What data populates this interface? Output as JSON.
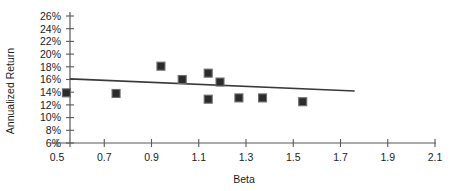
{
  "chart_data": {
    "type": "scatter",
    "title": "",
    "xlabel": "Beta",
    "ylabel": "Annualized Return",
    "xlim": [
      0.5,
      2.1
    ],
    "ylim": [
      6,
      26
    ],
    "grid": false,
    "legend": "none",
    "x_ticks": [
      "0.5",
      "0.7",
      "0.9",
      "1.1",
      "1.3",
      "1.5",
      "1.7",
      "1.9",
      "2.1"
    ],
    "x_tick_values": [
      0.5,
      0.7,
      0.9,
      1.1,
      1.3,
      1.5,
      1.7,
      1.9,
      2.1
    ],
    "y_ticks": [
      "6%",
      "8%",
      "10%",
      "12%",
      "14%",
      "16%",
      "18%",
      "20%",
      "22%",
      "24%",
      "26%"
    ],
    "y_tick_values": [
      6,
      8,
      10,
      12,
      14,
      16,
      18,
      20,
      22,
      24,
      26
    ],
    "points": [
      {
        "x": 0.54,
        "y": 13.9
      },
      {
        "x": 0.75,
        "y": 13.8
      },
      {
        "x": 0.94,
        "y": 18.1
      },
      {
        "x": 1.03,
        "y": 16.0
      },
      {
        "x": 1.14,
        "y": 17.0
      },
      {
        "x": 1.14,
        "y": 12.9
      },
      {
        "x": 1.19,
        "y": 15.6
      },
      {
        "x": 1.27,
        "y": 13.1
      },
      {
        "x": 1.37,
        "y": 13.1
      },
      {
        "x": 1.54,
        "y": 12.5
      }
    ],
    "trendline": {
      "x_start": 0.555,
      "y_start": 16.1,
      "x_end": 1.76,
      "y_end": 14.2
    },
    "marker_style": "filled-square",
    "marker_color": "#2b2b2b",
    "line_color": "#3a3a3a",
    "axis_color": "#595959"
  }
}
